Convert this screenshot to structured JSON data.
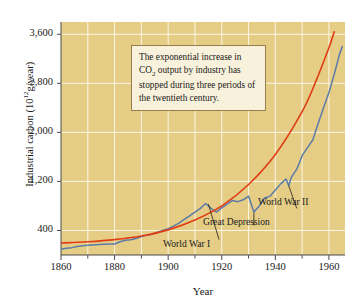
{
  "chart_data": {
    "type": "line",
    "title": "",
    "xlabel": "Year",
    "ylabel": "Industrial carbon (10^12 g/year)",
    "ylabel_text": "Industrial carbon (10",
    "ylabel_exp": "12",
    "ylabel_tail": "g/year)",
    "xlim": [
      1860,
      1966
    ],
    "ylim": [
      0,
      3800
    ],
    "grid": true,
    "grid_x_step": 10,
    "grid_y_step": 800,
    "legend": "none",
    "background_color": "#e5cd86",
    "gridline_color": "#fbf6e4",
    "xticks": [
      1860,
      1880,
      1900,
      1920,
      1940,
      1960
    ],
    "xtick_labels": [
      "1860",
      "1880",
      "1900",
      "1920",
      "1940",
      "1960"
    ],
    "xticks_minor": [
      1870,
      1890,
      1910,
      1930,
      1950
    ],
    "yticks": [
      400,
      1200,
      2000,
      2800,
      3600
    ],
    "ytick_labels": [
      "400",
      "1,200",
      "2,000",
      "2,800",
      "3,600"
    ],
    "series": [
      {
        "name": "Industrial carbon emissions (measured)",
        "color": "#5c7aa8",
        "type": "line",
        "x": [
          1860,
          1862,
          1864,
          1866,
          1868,
          1870,
          1872,
          1874,
          1876,
          1878,
          1880,
          1882,
          1884,
          1886,
          1888,
          1890,
          1892,
          1894,
          1896,
          1898,
          1900,
          1902,
          1904,
          1906,
          1908,
          1910,
          1912,
          1914,
          1916,
          1918,
          1920,
          1922,
          1924,
          1926,
          1928,
          1930,
          1932,
          1934,
          1936,
          1938,
          1940,
          1942,
          1944,
          1945,
          1946,
          1948,
          1950,
          1952,
          1954,
          1956,
          1958,
          1960,
          1962,
          1964,
          1965
        ],
        "y": [
          95,
          110,
          120,
          140,
          150,
          160,
          165,
          170,
          175,
          178,
          180,
          215,
          240,
          250,
          270,
          300,
          320,
          340,
          370,
          400,
          430,
          470,
          520,
          580,
          640,
          700,
          760,
          840,
          760,
          700,
          770,
          830,
          890,
          870,
          900,
          960,
          700,
          800,
          930,
          960,
          1060,
          1160,
          1240,
          1130,
          1270,
          1400,
          1620,
          1750,
          1880,
          2150,
          2400,
          2650,
          2950,
          3280,
          3400
        ]
      },
      {
        "name": "Exponential trend",
        "color": "#e03c14",
        "type": "line",
        "smooth": true,
        "x": [
          1860,
          1870,
          1880,
          1890,
          1900,
          1910,
          1920,
          1930,
          1940,
          1950,
          1955,
          1960,
          1962
        ],
        "y": [
          195,
          215,
          250,
          310,
          410,
          570,
          800,
          1150,
          1640,
          2340,
          2820,
          3380,
          3640
        ]
      }
    ],
    "annotations": [
      {
        "label": "World War I",
        "x": 1915,
        "y": 830,
        "text_x": 1919,
        "text_y": 250
      },
      {
        "label": "Great Depression",
        "x": 1932,
        "y": 690,
        "text_x": 1932,
        "text_y": 480
      },
      {
        "label": "World War II",
        "x": 1945,
        "y": 1130,
        "text_x": 1948,
        "text_y": 760
      }
    ],
    "callout": {
      "line1": "The exponential increase in",
      "line2a": "CO",
      "line2sub": "2",
      "line2b": " output by industry has",
      "line3": "stopped during three periods",
      "line4": "of the twentieth century."
    }
  }
}
